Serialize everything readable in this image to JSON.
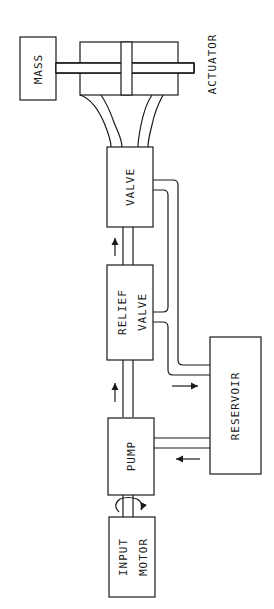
{
  "diagram": {
    "orientation": "rotated-90-ccw",
    "components": [
      {
        "id": "mass",
        "label": "MASS"
      },
      {
        "id": "actuator",
        "label": "ACTUATOR"
      },
      {
        "id": "valve",
        "label": "VALVE"
      },
      {
        "id": "relief_valve",
        "label_line1": "RELIEF",
        "label_line2": "VALVE"
      },
      {
        "id": "reservoir",
        "label": "RESERVOIR"
      },
      {
        "id": "pump",
        "label": "PUMP"
      },
      {
        "id": "input_motor",
        "label_line1": "INPUT",
        "label_line2": "MOTOR"
      }
    ],
    "connections": [
      {
        "from": "input_motor",
        "to": "pump",
        "type": "rotating shaft"
      },
      {
        "from": "pump",
        "to": "relief_valve",
        "type": "pressure line"
      },
      {
        "from": "relief_valve",
        "to": "valve",
        "type": "pressure line"
      },
      {
        "from": "valve",
        "to": "actuator",
        "type": "two hydraulic lines"
      },
      {
        "from": "actuator",
        "to": "mass",
        "type": "piston rod"
      },
      {
        "from": "relief_valve",
        "to": "reservoir",
        "type": "return line"
      },
      {
        "from": "valve",
        "to": "reservoir",
        "type": "return line"
      },
      {
        "from": "reservoir",
        "to": "pump",
        "type": "supply line"
      }
    ],
    "colors": {
      "line": "#1a1a1a",
      "background": "#ffffff"
    }
  }
}
